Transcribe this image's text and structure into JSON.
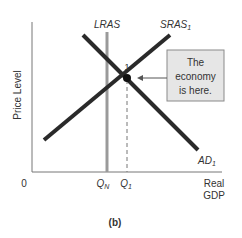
{
  "figure": {
    "panel_label": "(b)",
    "axes": {
      "y_label": "Price Level",
      "x_label_line1": "Real",
      "x_label_line2": "GDP",
      "origin": "0"
    },
    "curves": {
      "lras": {
        "name": "LRAS",
        "color": "#9a9a9a"
      },
      "sras": {
        "name": "SRAS",
        "subscript": "1",
        "color": "#2a2a2a"
      },
      "ad": {
        "name": "AD",
        "subscript": "1",
        "color": "#2a2a2a"
      }
    },
    "equilibrium": {
      "label": "1"
    },
    "x_ticks": {
      "qn": {
        "base": "Q",
        "sub": "N"
      },
      "q1": {
        "base": "Q",
        "sub": "1"
      }
    },
    "callout": {
      "line1": "The",
      "line2": "economy",
      "line3": "is here.",
      "fill": "#e6e6e6"
    }
  }
}
